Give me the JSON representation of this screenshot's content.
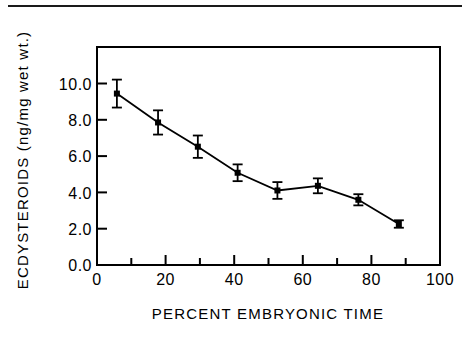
{
  "figure": {
    "top_rule": "horizontal-rule"
  },
  "chart_data": {
    "type": "line",
    "title": "",
    "xlabel": "PERCENT EMBRYONIC TIME",
    "ylabel": "ECDYSTEROIDS (ng/mg wet wt.)",
    "xlim": [
      0,
      100
    ],
    "ylim": [
      0.0,
      11.7
    ],
    "grid": false,
    "legend": "none",
    "xticks": [
      0,
      20,
      40,
      60,
      80,
      100
    ],
    "xtick_labels": [
      "0",
      "20",
      "40",
      "60",
      "80",
      "100"
    ],
    "xminor_ticks": [
      10,
      30,
      50,
      70,
      90
    ],
    "yticks": [
      0.0,
      2.0,
      4.0,
      6.0,
      8.0,
      10.0
    ],
    "ytick_labels": [
      "0.0",
      "2.0",
      "4.0",
      "6.0",
      "8.0",
      "10.0"
    ],
    "series": [
      {
        "name": "Ecdysteroids",
        "marker": "filled-square",
        "x": [
          5.8,
          17.8,
          29.4,
          41.0,
          52.6,
          64.4,
          76.2,
          88.0
        ],
        "values": [
          9.2,
          7.65,
          6.35,
          4.95,
          4.0,
          4.25,
          3.5,
          2.2
        ],
        "yerr": [
          0.75,
          0.65,
          0.6,
          0.45,
          0.45,
          0.4,
          0.3,
          0.2
        ]
      }
    ]
  }
}
